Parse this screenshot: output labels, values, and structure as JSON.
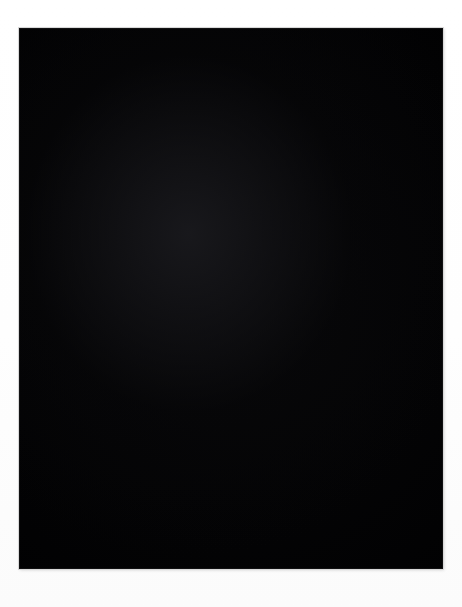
{
  "image": {
    "kind": "astronomical-photograph",
    "subject_title": "Irregular starburst galaxy with super star clusters",
    "color_mode": "grayscale",
    "width_px": 462,
    "height_px": 607,
    "mount_color": "#fdfdfd",
    "sky_color": "#010102",
    "star_color": "#ffffff",
    "alt_text": "Black-and-white deep-sky photograph of a bright irregular galaxy with two luminous cores and many resolved star clusters, set against a sparse field of foreground stars."
  },
  "plate": {
    "left": 19,
    "top": 28,
    "width": 424,
    "height": 541,
    "border_color": "#d8d8d8"
  },
  "features": {
    "galaxy_envelope": [
      {
        "name": "outer-halo",
        "cx": 205,
        "cy": 185,
        "rx": 120,
        "ry": 155,
        "rot": -38,
        "peak": 0.16
      },
      {
        "name": "main-body",
        "cx": 195,
        "cy": 175,
        "rx": 92,
        "ry": 120,
        "rot": -38,
        "peak": 0.26
      },
      {
        "name": "northwest-lobe",
        "cx": 124,
        "cy": 132,
        "rx": 52,
        "ry": 46,
        "rot": -30,
        "peak": 0.42
      },
      {
        "name": "core-lobe",
        "cx": 168,
        "cy": 190,
        "rx": 58,
        "ry": 46,
        "rot": -20,
        "peak": 0.5
      },
      {
        "name": "southern-plume",
        "cx": 218,
        "cy": 290,
        "rx": 62,
        "ry": 86,
        "rot": -12,
        "peak": 0.3
      },
      {
        "name": "eastern-wing",
        "cx": 255,
        "cy": 215,
        "rx": 66,
        "ry": 70,
        "rot": -45,
        "peak": 0.22
      },
      {
        "name": "south-tail",
        "cx": 210,
        "cy": 360,
        "rx": 48,
        "ry": 52,
        "rot": 5,
        "peak": 0.14
      }
    ],
    "bright_cores": [
      {
        "name": "super-star-cluster-A",
        "cx": 124,
        "cy": 132,
        "size": 26,
        "intensity": 1.0
      },
      {
        "name": "super-star-cluster-B",
        "cx": 163,
        "cy": 192,
        "size": 30,
        "intensity": 1.0
      }
    ],
    "background_galaxies": [
      {
        "name": "edge-on-spiral",
        "cx": 308,
        "cy": 294,
        "len": 26,
        "thick": 6,
        "rot": -34,
        "intensity": 0.55
      },
      {
        "name": "faint-clump",
        "cx": 306,
        "cy": 498,
        "len": 16,
        "thick": 7,
        "rot": 20,
        "intensity": 0.3
      }
    ],
    "diffraction_stars": [
      {
        "name": "bright-field-star-east",
        "cx": 420,
        "cy": 309,
        "core": 11,
        "span": 62
      },
      {
        "name": "bright-field-star-nebula",
        "cx": 266,
        "cy": 238,
        "core": 7,
        "span": 36
      },
      {
        "name": "bright-field-star-core",
        "cx": 163,
        "cy": 192,
        "core": 8,
        "span": 40
      },
      {
        "name": "bright-field-star-sw",
        "cx": 59,
        "cy": 439,
        "core": 6,
        "span": 26
      },
      {
        "name": "bright-field-star-se",
        "cx": 359,
        "cy": 492,
        "core": 6,
        "span": 26
      },
      {
        "name": "bright-field-star-nw",
        "cx": 88,
        "cy": 284,
        "core": 5,
        "span": 20
      },
      {
        "name": "bright-field-star-mid",
        "cx": 163,
        "cy": 308,
        "core": 5,
        "span": 22
      }
    ],
    "star_field_count": 360,
    "cluster_star_count": 120
  },
  "labels": {
    "none_visible": ""
  }
}
